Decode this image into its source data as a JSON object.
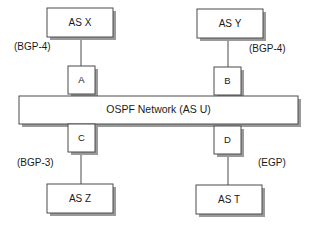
{
  "diagram": {
    "background_color": "#ffffff",
    "line_color": "#4a4a4a",
    "shadow_color": "#9a9a9a",
    "text_color": "#1a1a1a",
    "backbone": {
      "label": "OSPF Network (AS U)"
    },
    "autonomous_systems": [
      {
        "id": "as-x",
        "label": "AS X",
        "position": "top-left"
      },
      {
        "id": "as-y",
        "label": "AS Y",
        "position": "top-right"
      },
      {
        "id": "as-z",
        "label": "AS Z",
        "position": "bottom-left"
      },
      {
        "id": "as-t",
        "label": "AS T",
        "position": "bottom-right"
      }
    ],
    "routers": [
      {
        "id": "router-a",
        "label": "A",
        "position": "top-left"
      },
      {
        "id": "router-b",
        "label": "B",
        "position": "top-right"
      },
      {
        "id": "router-c",
        "label": "C",
        "position": "bottom-left"
      },
      {
        "id": "router-d",
        "label": "D",
        "position": "bottom-right"
      }
    ],
    "protocol_labels": [
      {
        "id": "proto-top-left",
        "label": "(BGP-4)",
        "connects": "AS X - A"
      },
      {
        "id": "proto-top-right",
        "label": "(BGP-4)",
        "connects": "AS Y - B"
      },
      {
        "id": "proto-bottom-left",
        "label": "(BGP-3)",
        "connects": "C - AS Z"
      },
      {
        "id": "proto-bottom-right",
        "label": "(EGP)",
        "connects": "D - AS T"
      }
    ]
  }
}
